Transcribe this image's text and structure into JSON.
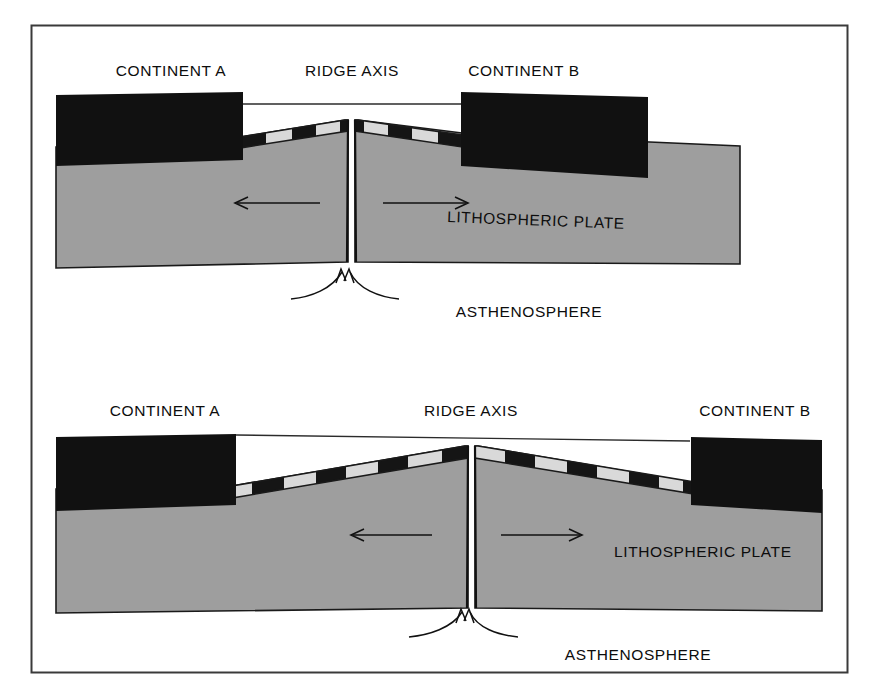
{
  "figure": {
    "frame_color": "#3a3a3a",
    "background_color": "#ffffff"
  },
  "palette": {
    "continent_fill": "#111111",
    "lithosphere_fill": "#9e9e9e",
    "stripe_dark": "#151515",
    "stripe_light": "#d9d9d9",
    "outline": "#1a1a1a",
    "text": "#0d0d0d",
    "water_line": "#2b2b2b"
  },
  "panels": [
    {
      "id": "panel-upper",
      "name": "early-stage",
      "labels": {
        "continent_a": "CONTINENT A",
        "ridge_axis": "RIDGE AXIS",
        "continent_b": "CONTINENT B",
        "lithospheric_plate": "LITHOSPHERIC PLATE",
        "asthenosphere": "ASTHENOSPHERE"
      },
      "arrows": {
        "left_spreading": "←",
        "right_spreading": "→",
        "upwelling": "upwelling-arrows"
      },
      "magnetic_stripes": {
        "left_count": 4,
        "right_count": 4,
        "pattern": [
          "dark",
          "light",
          "dark",
          "light"
        ]
      }
    },
    {
      "id": "panel-lower",
      "name": "later-stage",
      "labels": {
        "continent_a": "CONTINENT A",
        "ridge_axis": "RIDGE AXIS",
        "continent_b": "CONTINENT B",
        "lithospheric_plate": "LITHOSPHERIC PLATE",
        "asthenosphere": "ASTHENOSPHERE"
      },
      "arrows": {
        "left_spreading": "←",
        "right_spreading": "→",
        "upwelling": "upwelling-arrows"
      },
      "magnetic_stripes": {
        "left_count": 7,
        "right_count": 7,
        "pattern": [
          "dark",
          "light",
          "dark",
          "light",
          "dark",
          "light",
          "dark"
        ]
      }
    }
  ]
}
